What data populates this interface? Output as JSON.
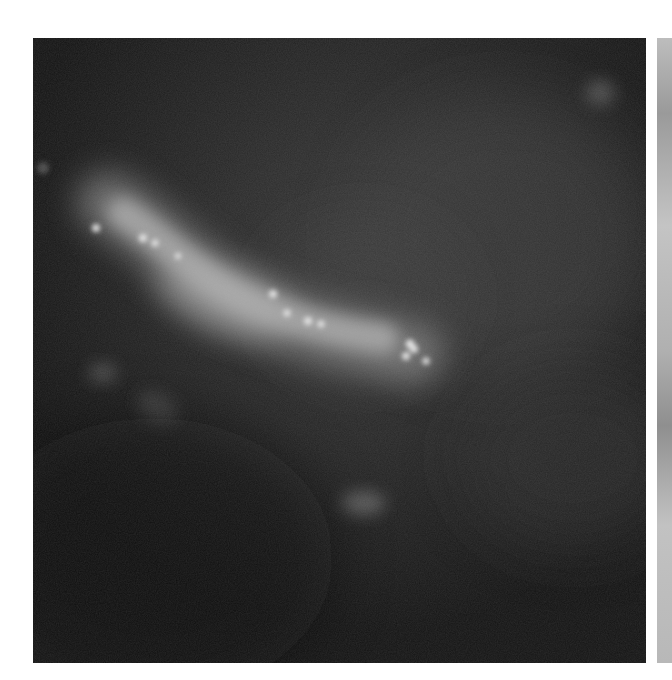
{
  "figure": {
    "type": "fluorescence-microscopy",
    "colormap": "grayscale",
    "panels": [
      {
        "id": "main",
        "background": "#141414",
        "features": {
          "main_structure": "elongated bright diagonal filament from upper-left to center-right",
          "bright_puncta_count_approx": 12,
          "dim_blobs": [
            "lower-left faint streak",
            "lower-center small blob",
            "upper-right faint spot"
          ]
        }
      },
      {
        "id": "right-partial",
        "background": "#b4b4b4",
        "cropped": true
      }
    ]
  }
}
